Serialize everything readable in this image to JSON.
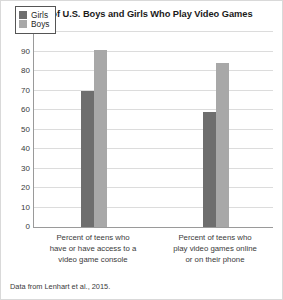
{
  "figure": {
    "title": "Percent of U.S. Boys and Girls Who Play Video Games",
    "source_note": "Data from Lenhart et al., 2015."
  },
  "legend": {
    "position": "top-left-inside",
    "entries": [
      {
        "label": "Girls",
        "color": "#6e6e6e"
      },
      {
        "label": "Boys",
        "color": "#a8a8a8"
      }
    ]
  },
  "axis": {
    "y_ticks": [
      "0",
      "10",
      "20",
      "30",
      "40",
      "50",
      "60",
      "70",
      "80",
      "90",
      "100"
    ]
  },
  "chart_data": {
    "type": "bar",
    "title": "Percent of U.S. Boys and Girls Who Play Video Games",
    "xlabel": "",
    "ylabel": "",
    "ylim": [
      0,
      100
    ],
    "ytick_step": 10,
    "grid": true,
    "legend_position": "upper left",
    "categories": [
      "Percent of teens who have or have access to a video game console",
      "Percent of teens who play video games online or on their phone"
    ],
    "category_lines": [
      [
        "Percent of teens who",
        "have or have access to a",
        "video game console"
      ],
      [
        "Percent of teens who",
        "play video games online",
        "or on their phone"
      ]
    ],
    "series": [
      {
        "name": "Girls",
        "color": "#6e6e6e",
        "values": [
          70,
          59
        ]
      },
      {
        "name": "Boys",
        "color": "#a8a8a8",
        "values": [
          91,
          84
        ]
      }
    ],
    "annotation": "Data from Lenhart et al., 2015."
  }
}
